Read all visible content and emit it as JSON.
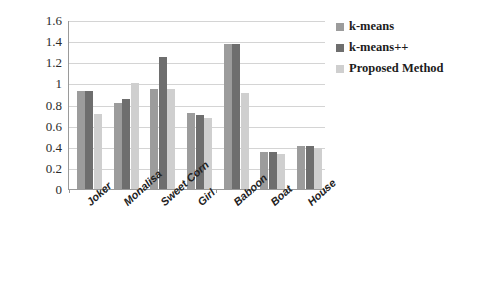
{
  "chart_data": {
    "type": "bar",
    "title": "",
    "subtitle": "",
    "xlabel": "",
    "ylabel": "",
    "ylim": [
      0,
      1.6
    ],
    "yticks": [
      "0",
      "0.2",
      "0.4",
      "0.6",
      "0.8",
      "1",
      "1.2",
      "1.4",
      "1.6"
    ],
    "ytick_values": [
      0,
      0.2,
      0.4,
      0.6,
      0.8,
      1.0,
      1.2,
      1.4,
      1.6
    ],
    "grid": true,
    "legend_position": "right",
    "categories": [
      "Joker",
      "Monalisa",
      "Sweet Corn",
      "Girl",
      "Baboon",
      "Boat",
      "House"
    ],
    "series": [
      {
        "name": "k-means",
        "color": "#9c9c9c",
        "values": [
          0.93,
          0.81,
          0.95,
          0.72,
          1.37,
          0.35,
          0.41
        ]
      },
      {
        "name": "k-means++",
        "color": "#6e6e6e",
        "values": [
          0.93,
          0.85,
          1.25,
          0.7,
          1.37,
          0.35,
          0.41
        ]
      },
      {
        "name": "Proposed Method",
        "color": "#cfcfcf",
        "values": [
          0.71,
          1.0,
          0.95,
          0.67,
          0.91,
          0.33,
          0.39
        ]
      }
    ]
  }
}
